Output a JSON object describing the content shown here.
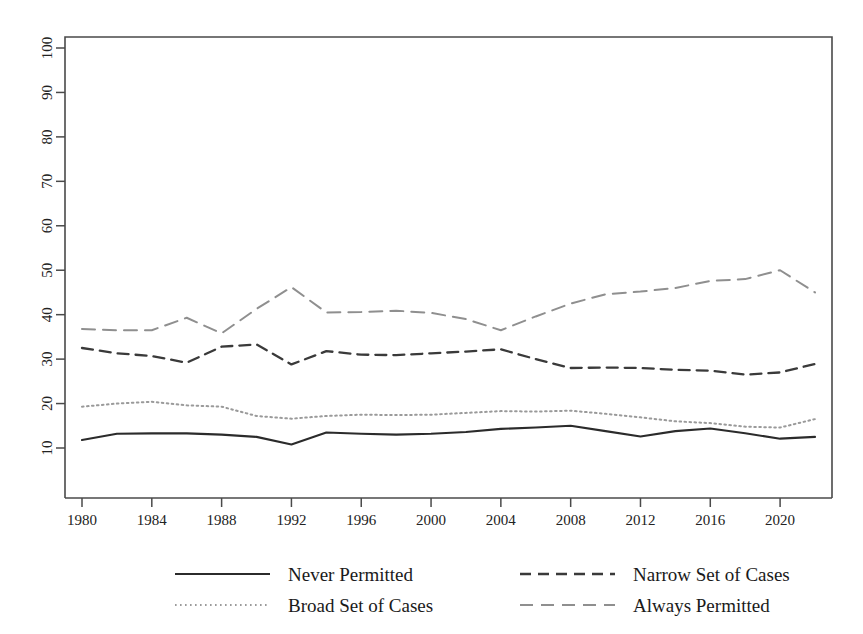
{
  "chart_data": {
    "type": "line",
    "title": "",
    "xlabel": "",
    "ylabel": "",
    "xlim": [
      1980,
      2022
    ],
    "ylim": [
      0,
      100
    ],
    "grid": false,
    "legend_position": "bottom",
    "xticks": [
      1980,
      1984,
      1988,
      1992,
      1996,
      2000,
      2004,
      2008,
      2012,
      2016,
      2020
    ],
    "yticks": [
      10,
      20,
      30,
      40,
      50,
      60,
      70,
      80,
      90,
      100
    ],
    "x": [
      1980,
      1982,
      1984,
      1986,
      1988,
      1990,
      1992,
      1994,
      1996,
      1998,
      2000,
      2002,
      2004,
      2006,
      2008,
      2010,
      2012,
      2014,
      2016,
      2018,
      2020,
      2022
    ],
    "series": [
      {
        "name": "Never Permitted",
        "style": "solid",
        "color": "#2b2b2b",
        "values": [
          11.8,
          13.2,
          13.3,
          13.3,
          13.0,
          12.5,
          10.8,
          13.5,
          13.2,
          13.0,
          13.2,
          13.6,
          14.3,
          14.6,
          15.0,
          13.8,
          12.6,
          13.8,
          14.4,
          13.3,
          12.1,
          12.5
        ]
      },
      {
        "name": "Narrow Set of Cases",
        "style": "dashed",
        "color": "#3a3a3a",
        "values": [
          32.5,
          31.3,
          30.7,
          29.2,
          32.8,
          33.3,
          28.8,
          31.8,
          31.0,
          30.9,
          31.3,
          31.7,
          32.2,
          30.0,
          28.0,
          28.1,
          28.0,
          27.6,
          27.4,
          26.5,
          27.0,
          28.9
        ]
      },
      {
        "name": "Broad Set of Cases",
        "style": "dotted",
        "color": "#9a9a9a",
        "values": [
          19.3,
          20.0,
          20.4,
          19.6,
          19.3,
          17.2,
          16.6,
          17.2,
          17.5,
          17.4,
          17.5,
          17.9,
          18.3,
          18.2,
          18.4,
          17.7,
          16.9,
          16.0,
          15.6,
          14.8,
          14.6,
          16.5
        ]
      },
      {
        "name": "Always Permitted",
        "style": "dashdot",
        "color": "#8f8f8f",
        "values": [
          36.8,
          36.5,
          36.5,
          39.3,
          35.8,
          41.3,
          46.2,
          40.5,
          40.6,
          40.9,
          40.4,
          39.0,
          36.5,
          39.6,
          42.5,
          44.6,
          45.2,
          46.0,
          47.6,
          48.0,
          50.0,
          45.0
        ]
      }
    ]
  },
  "legend": {
    "entries": [
      {
        "label": "Never Permitted",
        "style": "solid"
      },
      {
        "label": "Narrow Set of Cases",
        "style": "dashed"
      },
      {
        "label": "Broad Set of Cases",
        "style": "dotted"
      },
      {
        "label": "Always Permitted",
        "style": "dashdot"
      }
    ]
  },
  "axes": {
    "frame_color": "#4a4a4a"
  }
}
